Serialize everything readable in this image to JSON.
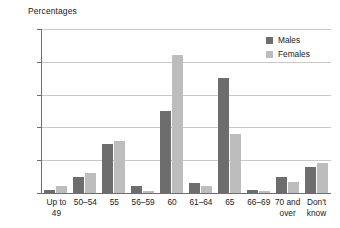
{
  "chart_data": {
    "type": "bar",
    "title": "",
    "ylabel": "Percentages",
    "xlabel": "",
    "ylim": [
      0,
      50
    ],
    "yticks": [
      0,
      10,
      20,
      30,
      40,
      50
    ],
    "grid": true,
    "legend_position": "top-right",
    "categories": [
      "Up to 49",
      "50–54",
      "55",
      "56–59",
      "60",
      "61–64",
      "65",
      "66–69",
      "70 and\nover",
      "Don't\nknow"
    ],
    "series": [
      {
        "name": "Males",
        "color": "#6d6d6d",
        "values": [
          1,
          5,
          15,
          2,
          25,
          3,
          35,
          0.8,
          5,
          8
        ]
      },
      {
        "name": "Females",
        "color": "#bdbdbd",
        "values": [
          2,
          6,
          16,
          0.6,
          42,
          2,
          18,
          0.7,
          3.5,
          9
        ]
      }
    ]
  }
}
